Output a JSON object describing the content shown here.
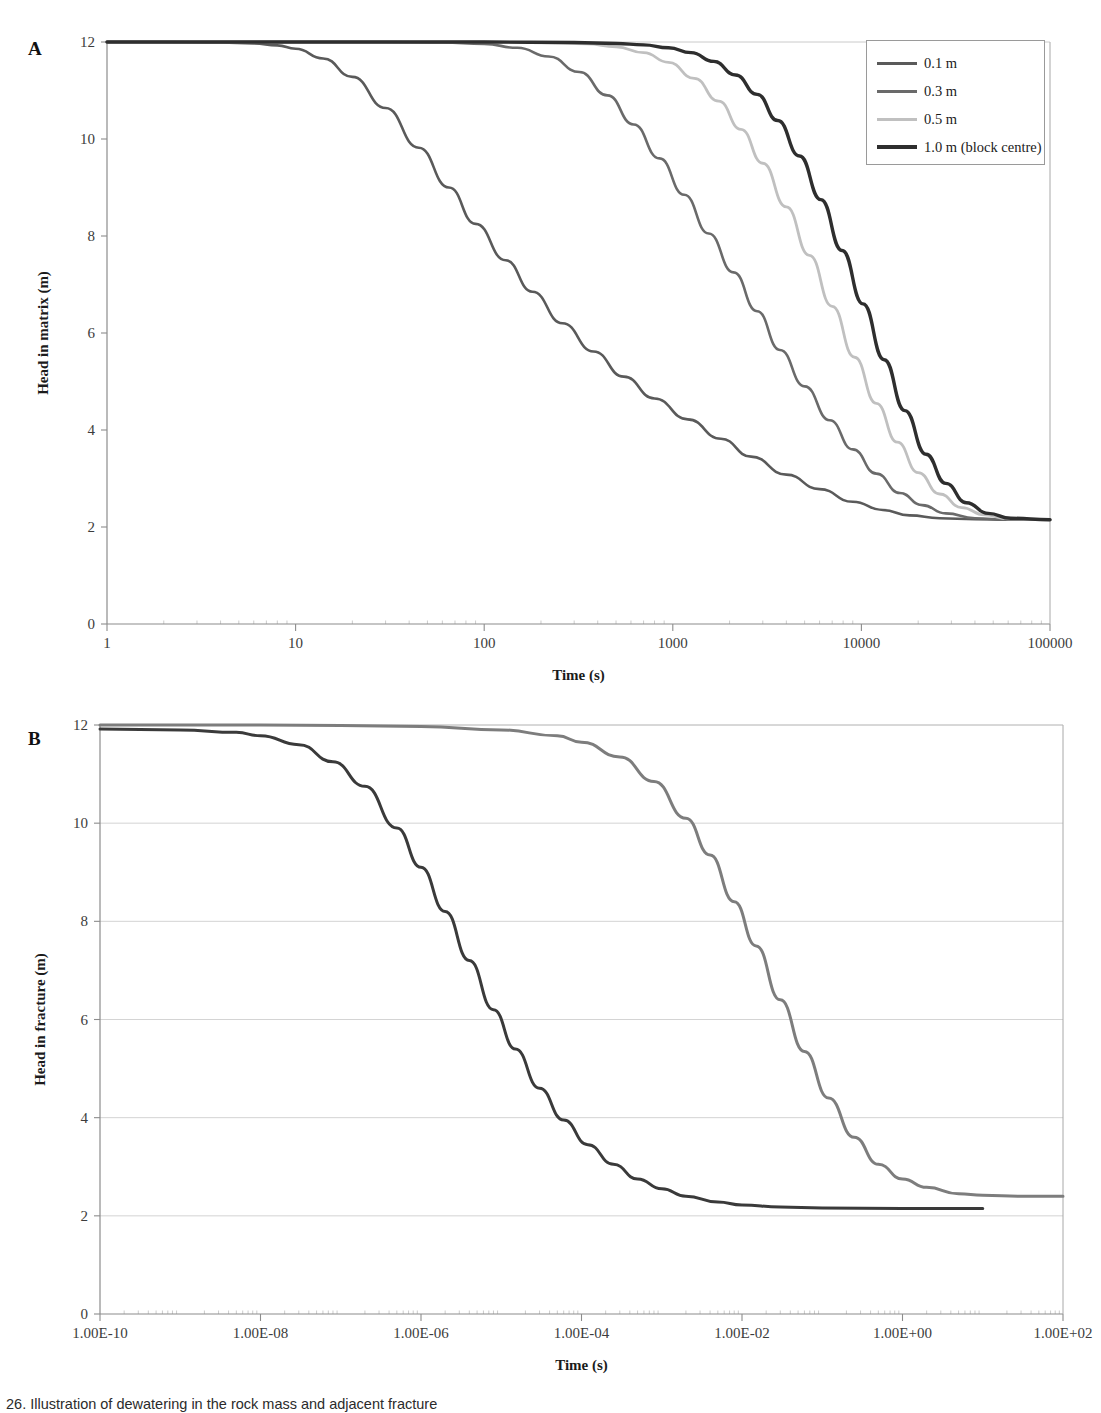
{
  "figure": {
    "caption": "26. Illustration of dewatering in the rock mass and adjacent fracture"
  },
  "panel_a": {
    "letter": "A"
  },
  "panel_b": {
    "letter": "B"
  },
  "chart_data": [
    {
      "panel": "A",
      "type": "line",
      "title": "",
      "xlabel": "Time (s)",
      "ylabel": "Head in matrix (m)",
      "xscale": "log",
      "xlim": [
        1,
        100000
      ],
      "ylim": [
        0,
        12
      ],
      "xticks": [
        "1",
        "10",
        "100",
        "1000",
        "10000",
        "100000"
      ],
      "xtick_values": [
        1,
        10,
        100,
        1000,
        10000,
        100000
      ],
      "yticks": [
        "0",
        "2",
        "4",
        "6",
        "8",
        "10",
        "12"
      ],
      "ytick_values": [
        0,
        2,
        4,
        6,
        8,
        10,
        12
      ],
      "grid": false,
      "legend_position": "top-right",
      "series": [
        {
          "name": "0.1 m",
          "color": "#5a5a5a",
          "width": 2.6,
          "x": [
            1,
            2,
            4,
            6,
            8,
            10,
            14,
            20,
            30,
            45,
            65,
            90,
            130,
            180,
            260,
            380,
            550,
            800,
            1200,
            1800,
            2600,
            4000,
            6000,
            9000,
            13000,
            18000,
            26000,
            40000,
            60000,
            100000
          ],
          "y": [
            12.0,
            12.0,
            11.99,
            11.97,
            11.93,
            11.86,
            11.66,
            11.28,
            10.64,
            9.82,
            9.0,
            8.25,
            7.5,
            6.85,
            6.2,
            5.62,
            5.1,
            4.65,
            4.22,
            3.82,
            3.45,
            3.08,
            2.78,
            2.52,
            2.35,
            2.24,
            2.18,
            2.16,
            2.15,
            2.15
          ]
        },
        {
          "name": "0.3 m",
          "color": "#6a6a6a",
          "width": 2.6,
          "x": [
            1,
            10,
            30,
            60,
            100,
            150,
            220,
            320,
            450,
            620,
            850,
            1150,
            1550,
            2100,
            2800,
            3700,
            5000,
            6800,
            9000,
            12000,
            16000,
            21000,
            28000,
            40000,
            60000,
            100000
          ],
          "y": [
            12.0,
            12.0,
            12.0,
            11.99,
            11.96,
            11.88,
            11.7,
            11.38,
            10.9,
            10.3,
            9.6,
            8.85,
            8.05,
            7.25,
            6.45,
            5.65,
            4.9,
            4.2,
            3.6,
            3.1,
            2.7,
            2.45,
            2.28,
            2.18,
            2.15,
            2.15
          ]
        },
        {
          "name": "0.5 m",
          "color": "#c0c0c0",
          "width": 2.8,
          "x": [
            1,
            10,
            100,
            200,
            350,
            500,
            700,
            950,
            1300,
            1750,
            2300,
            3000,
            4000,
            5300,
            7000,
            9200,
            12000,
            15500,
            20000,
            26000,
            34000,
            45000,
            60000,
            100000
          ],
          "y": [
            12.0,
            12.0,
            12.0,
            11.99,
            11.96,
            11.9,
            11.78,
            11.58,
            11.25,
            10.78,
            10.2,
            9.5,
            8.6,
            7.6,
            6.55,
            5.5,
            4.55,
            3.75,
            3.12,
            2.68,
            2.4,
            2.25,
            2.17,
            2.15
          ]
        },
        {
          "name": "1.0 m (block centre)",
          "color": "#2e2e2e",
          "width": 3.4,
          "x": [
            1,
            10,
            100,
            300,
            500,
            700,
            950,
            1250,
            1650,
            2150,
            2800,
            3600,
            4700,
            6100,
            7900,
            10200,
            13200,
            17000,
            22000,
            28000,
            36000,
            47000,
            62000,
            100000
          ],
          "y": [
            12.0,
            12.0,
            12.0,
            11.99,
            11.97,
            11.94,
            11.88,
            11.78,
            11.6,
            11.32,
            10.92,
            10.38,
            9.65,
            8.75,
            7.7,
            6.6,
            5.45,
            4.4,
            3.5,
            2.9,
            2.5,
            2.28,
            2.18,
            2.15
          ]
        }
      ]
    },
    {
      "panel": "B",
      "type": "line",
      "title": "",
      "xlabel": "Time (s)",
      "ylabel": "Head in fracture (m)",
      "xscale": "log",
      "xlim": [
        1e-10,
        100
      ],
      "ylim": [
        0,
        12
      ],
      "xticks": [
        "1.00E-10",
        "1.00E-08",
        "1.00E-06",
        "1.00E-04",
        "1.00E-02",
        "1.00E+00",
        "1.00E+02"
      ],
      "xtick_values": [
        1e-10,
        1e-08,
        1e-06,
        0.0001,
        0.01,
        1,
        100
      ],
      "yticks": [
        "0",
        "2",
        "4",
        "6",
        "8",
        "10",
        "12"
      ],
      "ytick_values": [
        0,
        2,
        4,
        6,
        8,
        10,
        12
      ],
      "grid": true,
      "legend_position": "top-right",
      "series": [
        {
          "name": "Matric K 10-8 m/s",
          "name_base": "Matric K 10",
          "name_exp": "-8",
          "name_suffix": " m/s",
          "color": "#3a3a3a",
          "width": 3.0,
          "x": [
            1e-10,
            1e-09,
            5e-09,
            1e-08,
            3e-08,
            8e-08,
            2e-07,
            5e-07,
            1e-06,
            2e-06,
            4e-06,
            8e-06,
            1.5e-05,
            3e-05,
            6e-05,
            0.00012,
            0.00025,
            0.0005,
            0.001,
            0.002,
            0.005,
            0.01,
            0.03,
            0.1,
            1,
            10
          ],
          "y": [
            11.92,
            11.9,
            11.85,
            11.78,
            11.6,
            11.25,
            10.75,
            9.9,
            9.1,
            8.2,
            7.2,
            6.2,
            5.4,
            4.6,
            3.95,
            3.45,
            3.05,
            2.75,
            2.55,
            2.4,
            2.28,
            2.22,
            2.18,
            2.16,
            2.15,
            2.15
          ]
        },
        {
          "name": "Matric K 10-12 m/s",
          "name_base": "Matric K 10",
          "name_exp": "-12",
          "name_suffix": " m/s",
          "color": "#7d7d7d",
          "width": 3.0,
          "x": [
            1e-10,
            1e-08,
            1e-07,
            1e-06,
            1e-05,
            5e-05,
            0.0001,
            0.0003,
            0.0008,
            0.002,
            0.004,
            0.008,
            0.015,
            0.03,
            0.06,
            0.12,
            0.25,
            0.5,
            1,
            2,
            5,
            10,
            30,
            100
          ],
          "y": [
            12.0,
            12.0,
            11.99,
            11.97,
            11.9,
            11.78,
            11.65,
            11.35,
            10.85,
            10.1,
            9.35,
            8.4,
            7.5,
            6.4,
            5.35,
            4.4,
            3.6,
            3.05,
            2.75,
            2.58,
            2.45,
            2.42,
            2.4,
            2.4
          ]
        }
      ]
    }
  ],
  "legend_a": {
    "items": [
      {
        "label": "0.1 m",
        "color": "#5a5a5a",
        "width": 3
      },
      {
        "label": "0.3 m",
        "color": "#6a6a6a",
        "width": 3
      },
      {
        "label": "0.5 m",
        "color": "#c0c0c0",
        "width": 3
      },
      {
        "label": "1.0 m (block centre)",
        "color": "#2e2e2e",
        "width": 4
      }
    ]
  },
  "legend_b": {
    "items": [
      {
        "label": "Matric K 10-8 m/s",
        "color": "#3a3a3a",
        "width": 3
      },
      {
        "label": "Matric K 10-12 m/s",
        "color": "#7d7d7d",
        "width": 3
      }
    ]
  }
}
